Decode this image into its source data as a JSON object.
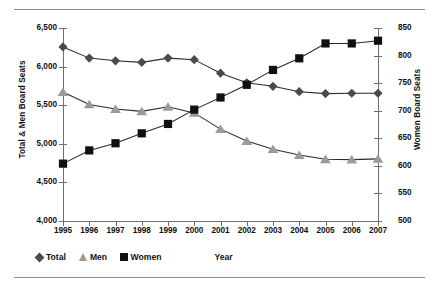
{
  "chart_data": {
    "type": "line",
    "title": "",
    "xlabel": "Year",
    "ylabel": "Total & Men Board Seats",
    "ylabel_right": "Women Board Seats",
    "grid": false,
    "legend_position": "bottom-left",
    "categories": [
      "1995",
      "1996",
      "1997",
      "1998",
      "1999",
      "2000",
      "2001",
      "2002",
      "2003",
      "2004",
      "2005",
      "2006",
      "2007"
    ],
    "ylim": [
      4000,
      6500
    ],
    "ylim_right": [
      500,
      850
    ],
    "yticks": [
      "4,000",
      "4,500",
      "5,000",
      "5,500",
      "6,000",
      "6,500"
    ],
    "ytick_values": [
      4000,
      4500,
      5000,
      5500,
      6000,
      6500
    ],
    "yticks_right": [
      "500",
      "550",
      "600",
      "650",
      "700",
      "750",
      "800",
      "850"
    ],
    "ytick_values_right": [
      500,
      550,
      600,
      650,
      700,
      750,
      800,
      850
    ],
    "series": [
      {
        "name": "Total",
        "axis": "left",
        "marker": "diamond",
        "color": "#4a4a4a",
        "values": [
          6255,
          6110,
          6075,
          6055,
          6110,
          6090,
          5915,
          5790,
          5745,
          5675,
          5650,
          5655,
          5655
        ]
      },
      {
        "name": "Men",
        "axis": "left",
        "marker": "triangle",
        "color": "#9a9a9a",
        "values": [
          5670,
          5510,
          5450,
          5420,
          5480,
          5400,
          5190,
          5035,
          4930,
          4855,
          4800,
          4795,
          4805
        ]
      },
      {
        "name": "Women",
        "axis": "right",
        "marker": "square",
        "color": "#101010",
        "values": [
          604,
          628,
          641,
          659,
          676,
          702,
          724,
          747,
          774,
          795,
          822,
          822,
          827
        ]
      }
    ],
    "legend": [
      {
        "label": "Total",
        "marker": "diamond",
        "color": "#4a4a4a"
      },
      {
        "label": "Men",
        "marker": "triangle",
        "color": "#9a9a9a"
      },
      {
        "label": "Women",
        "marker": "square",
        "color": "#101010"
      }
    ]
  }
}
